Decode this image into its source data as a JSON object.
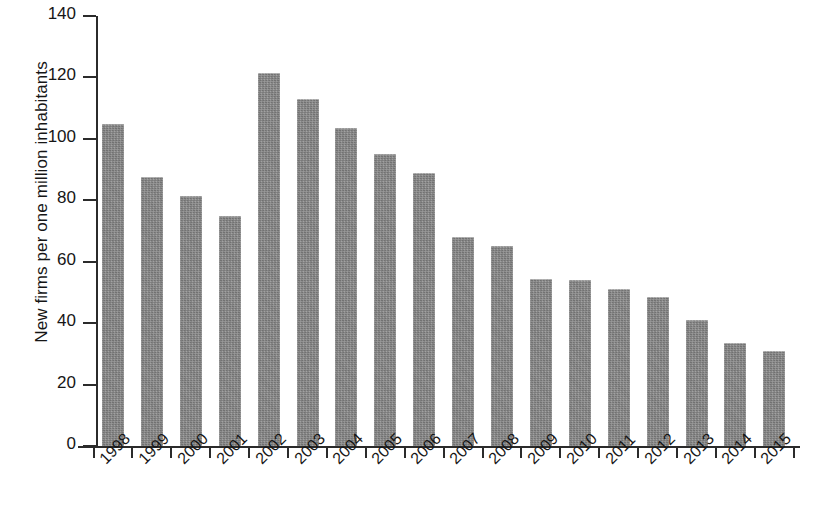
{
  "chart_data": {
    "type": "bar",
    "title": "",
    "xlabel": "",
    "ylabel": "New firms per one million inhabitants",
    "categories": [
      "1998",
      "1999",
      "2000",
      "2001",
      "2002",
      "2003",
      "2004",
      "2005",
      "2006",
      "2007",
      "2008",
      "2009",
      "2010",
      "2011",
      "2012",
      "2013",
      "2014",
      "2015"
    ],
    "values": [
      105,
      87.5,
      81.5,
      75,
      121.5,
      113,
      103.5,
      95,
      89,
      68,
      65,
      54.5,
      54,
      51,
      48.5,
      41,
      33.5,
      31
    ],
    "ylim": [
      0,
      140
    ],
    "ytick_labels": [
      "0",
      "20",
      "40",
      "60",
      "80",
      "100",
      "120",
      "140"
    ],
    "ytick_values": [
      0,
      20,
      40,
      60,
      80,
      100,
      120,
      140
    ],
    "grid": false,
    "legend": false,
    "legend_position": "none",
    "bar_color": "#848484",
    "axis_color": "#2b2b2b",
    "xtick_rotation": -45
  }
}
